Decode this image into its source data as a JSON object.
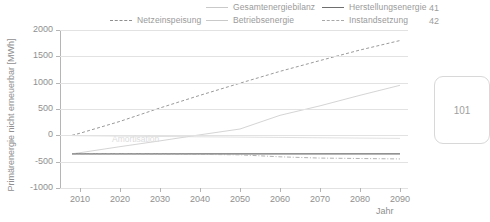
{
  "margin_notes": {
    "line_numbers": [
      "41",
      "42"
    ],
    "page_number": "101"
  },
  "legend": {
    "items": [
      {
        "label": "Netzeinspeisung",
        "style": "dashed",
        "color": "#8f8f8f"
      },
      {
        "label": "Gesamtenergiebilanz",
        "style": "solid-light",
        "color": "#c9c9c9"
      },
      {
        "label": "Betriebsenergie",
        "style": "solid-light",
        "color": "#c9c9c9"
      },
      {
        "label": "Herstellungsenergie",
        "style": "solid-dark",
        "color": "#6e6e6e"
      },
      {
        "label": "Instandsetzung",
        "style": "dash-dot",
        "color": "#a8a8a8"
      }
    ]
  },
  "chart_data": {
    "type": "line",
    "title": "",
    "xlabel": "Jahr",
    "ylabel": "Primärenergie nicht erneuerbar [MWh]",
    "xlim": [
      2005,
      2092
    ],
    "ylim": [
      -1000,
      2000
    ],
    "yticks": [
      2000,
      1500,
      1000,
      500,
      0,
      -500,
      -1000
    ],
    "xticks": [
      2010,
      2020,
      2030,
      2040,
      2050,
      2060,
      2070,
      2080,
      2090
    ],
    "grid": "horizontal",
    "legend_position": "top",
    "annotations": [
      {
        "text": "Amortisation",
        "x": 2018,
        "y": -90
      }
    ],
    "x": [
      2008,
      2010,
      2020,
      2030,
      2040,
      2050,
      2060,
      2070,
      2080,
      2090
    ],
    "series": [
      {
        "name": "Netzeinspeisung",
        "style": "dashed",
        "color": "#8f8f8f",
        "values": [
          0,
          40,
          265,
          520,
          760,
          990,
          1215,
          1420,
          1620,
          1800
        ]
      },
      {
        "name": "Gesamtenergiebilanz",
        "style": "solid-light",
        "color": "#cfcfcf",
        "values": [
          -350,
          -330,
          -215,
          -105,
          10,
          120,
          380,
          560,
          760,
          950
        ]
      },
      {
        "name": "Betriebsenergie",
        "style": "solid-light",
        "color": "#dcdcdc",
        "values": [
          -5,
          -8,
          -15,
          -22,
          -28,
          -34,
          -40,
          -46,
          -52,
          -58
        ]
      },
      {
        "name": "Herstellungsenergie",
        "style": "solid-dark",
        "color": "#6e6e6e",
        "values": [
          -352,
          -352,
          -352,
          -352,
          -352,
          -352,
          -352,
          -352,
          -352,
          -352
        ]
      },
      {
        "name": "Instandsetzung",
        "style": "dash-dot",
        "color": "#a8a8a8",
        "values": [
          -352,
          -352,
          -352,
          -356,
          -362,
          -370,
          -408,
          -432,
          -440,
          -448
        ]
      }
    ]
  }
}
